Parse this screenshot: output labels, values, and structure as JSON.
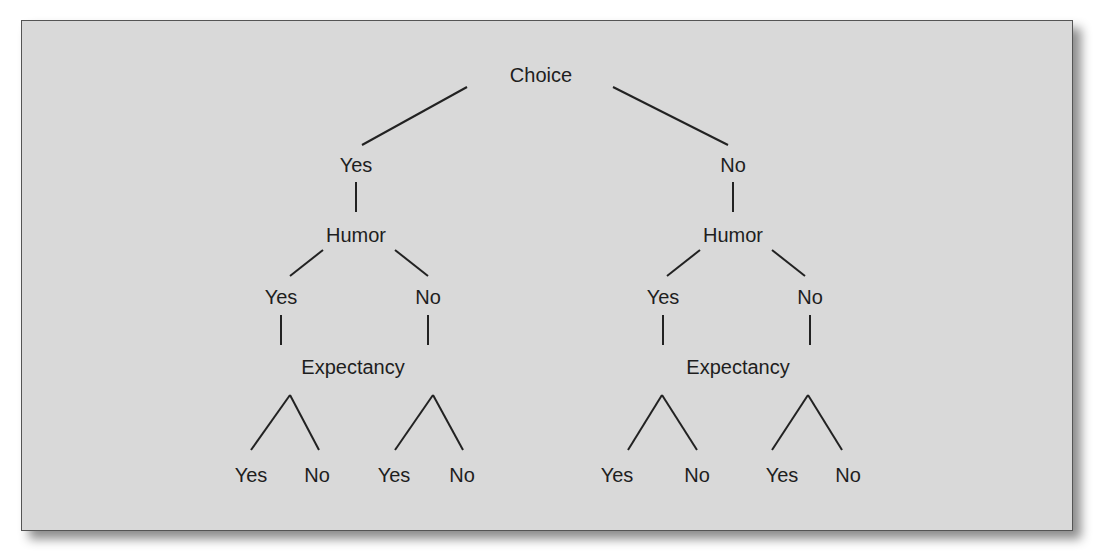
{
  "diagram": {
    "type": "tree",
    "root": "Choice",
    "nodes": [
      {
        "id": "choice",
        "label": "Choice",
        "x": 541,
        "y": 75
      },
      {
        "id": "l1_yes",
        "label": "Yes",
        "x": 356,
        "y": 165
      },
      {
        "id": "r1_no",
        "label": "No",
        "x": 733,
        "y": 165
      },
      {
        "id": "l_humor",
        "label": "Humor",
        "x": 356,
        "y": 235
      },
      {
        "id": "r_humor",
        "label": "Humor",
        "x": 733,
        "y": 235
      },
      {
        "id": "l_h_yes",
        "label": "Yes",
        "x": 281,
        "y": 297
      },
      {
        "id": "l_h_no",
        "label": "No",
        "x": 428,
        "y": 297
      },
      {
        "id": "r_h_yes",
        "label": "Yes",
        "x": 663,
        "y": 297
      },
      {
        "id": "r_h_no",
        "label": "No",
        "x": 810,
        "y": 297
      },
      {
        "id": "l_expectancy",
        "label": "Expectancy",
        "x": 353,
        "y": 367
      },
      {
        "id": "r_expectancy",
        "label": "Expectancy",
        "x": 738,
        "y": 367
      },
      {
        "id": "leaf1",
        "label": "Yes",
        "x": 251,
        "y": 475
      },
      {
        "id": "leaf2",
        "label": "No",
        "x": 317,
        "y": 475
      },
      {
        "id": "leaf3",
        "label": "Yes",
        "x": 394,
        "y": 475
      },
      {
        "id": "leaf4",
        "label": "No",
        "x": 462,
        "y": 475
      },
      {
        "id": "leaf5",
        "label": "Yes",
        "x": 617,
        "y": 475
      },
      {
        "id": "leaf6",
        "label": "No",
        "x": 697,
        "y": 475
      },
      {
        "id": "leaf7",
        "label": "Yes",
        "x": 782,
        "y": 475
      },
      {
        "id": "leaf8",
        "label": "No",
        "x": 848,
        "y": 475
      }
    ],
    "edges": [
      [
        467,
        87,
        362,
        145
      ],
      [
        613,
        87,
        728,
        145
      ],
      [
        356,
        182,
        356,
        212
      ],
      [
        733,
        182,
        733,
        212
      ],
      [
        323,
        250,
        290,
        276
      ],
      [
        395,
        250,
        428,
        276
      ],
      [
        700,
        250,
        667,
        276
      ],
      [
        772,
        250,
        805,
        276
      ],
      [
        281,
        315,
        281,
        345
      ],
      [
        428,
        315,
        428,
        345
      ],
      [
        663,
        315,
        663,
        345
      ],
      [
        810,
        315,
        810,
        345
      ],
      [
        290,
        395,
        251,
        450
      ],
      [
        290,
        395,
        319,
        450
      ],
      [
        433,
        395,
        395,
        450
      ],
      [
        433,
        395,
        463,
        450
      ],
      [
        662,
        395,
        628,
        450
      ],
      [
        662,
        395,
        697,
        450
      ],
      [
        808,
        395,
        772,
        450
      ],
      [
        808,
        395,
        842,
        450
      ]
    ],
    "colors": {
      "background": "#d9d9d9",
      "line": "#222222",
      "text": "#1e1e1e",
      "border": "#555555"
    }
  }
}
